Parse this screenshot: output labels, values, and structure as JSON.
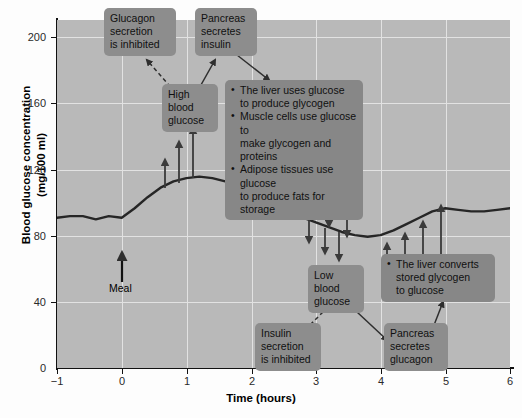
{
  "chart_data": {
    "type": "line",
    "title": "",
    "xlabel": "Time (hours)",
    "ylabel": "Blood glucose concentration\n(mg/100 ml)",
    "ylabel_line1": "Blood glucose concentration",
    "ylabel_line2": "(mg/100 ml)",
    "xlim": [
      -1,
      6
    ],
    "ylim": [
      0,
      220
    ],
    "xticks": [
      -1,
      0,
      1,
      2,
      3,
      4,
      5,
      6
    ],
    "xticklabels": [
      "−1",
      "0",
      "1",
      "2",
      "3",
      "4",
      "5",
      "6"
    ],
    "yticks": [
      0,
      40,
      80,
      120,
      160,
      200
    ],
    "yticklabels": [
      "0",
      "40",
      "80",
      "120",
      "160",
      "200"
    ],
    "grid": true,
    "legend": "none",
    "series": [
      {
        "name": "Blood glucose concentration",
        "x": [
          -1.0,
          -0.8,
          -0.6,
          -0.4,
          -0.2,
          0.0,
          0.2,
          0.4,
          0.6,
          0.8,
          1.0,
          1.2,
          1.4,
          1.6,
          1.8,
          2.0,
          2.2,
          2.4,
          2.6,
          2.8,
          3.0,
          3.2,
          3.4,
          3.6,
          3.8,
          4.0,
          4.2,
          4.4,
          4.6,
          4.8,
          5.0,
          5.2,
          5.4,
          5.6,
          5.8,
          6.0
        ],
        "y": [
          95,
          96,
          96,
          94,
          96,
          95,
          101,
          108,
          114,
          118,
          120,
          121,
          120,
          118,
          115,
          111,
          106,
          102,
          98,
          95,
          92,
          89,
          86,
          84,
          83,
          84,
          87,
          91,
          95,
          99,
          101,
          100,
          99,
          99,
          100,
          101
        ]
      }
    ],
    "annotations": [
      {
        "name": "meal-marker",
        "label": "Meal",
        "x": 0.0,
        "y": 95
      }
    ]
  },
  "callouts": {
    "glucagon_inhibited": {
      "lines": [
        "Glucagon",
        "secretion",
        "is inhibited"
      ]
    },
    "pancreas_insulin": {
      "lines": [
        "Pancreas",
        "secretes",
        "insulin"
      ]
    },
    "high_blood_glucose": {
      "lines": [
        "High",
        "blood",
        "glucose"
      ]
    },
    "insulin_effects": {
      "bullets": [
        "The liver uses glucose to produce glycogen",
        "Muscle cells use glucose to make glycogen and proteins",
        "Adipose tissues use glucose to produce fats for storage"
      ],
      "bullet_lines": [
        [
          "The liver uses glucose",
          "to produce glycogen"
        ],
        [
          "Muscle cells use glucose to",
          "make glycogen and proteins"
        ],
        [
          "Adipose tissues use glucose",
          "to produce fats for storage"
        ]
      ]
    },
    "low_blood_glucose": {
      "lines": [
        "Low",
        "blood",
        "glucose"
      ]
    },
    "insulin_inhibited": {
      "lines": [
        "Insulin",
        "secretion",
        "is inhibited"
      ]
    },
    "pancreas_glucagon": {
      "lines": [
        "Pancreas",
        "secretes",
        "glucagon"
      ]
    },
    "glucagon_effects": {
      "bullet_lines": [
        [
          "The liver converts",
          "stored glycogen",
          "to glucose"
        ]
      ]
    }
  },
  "colors": {
    "plot_background": "#b9b9b9",
    "gridline": "#e2e2e2",
    "curve": "#262626",
    "callout_background": "#8d8d8d",
    "axis": "#111111",
    "arrow": "#3a3a3a"
  }
}
